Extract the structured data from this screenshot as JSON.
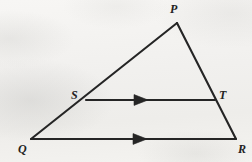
{
  "figure": {
    "background_color": "#f4f3f1",
    "stroke_color": "#252525",
    "label_color": "#232323",
    "stroke_width": 2.1,
    "label_font_size": 12,
    "vertices": [
      {
        "name": "P",
        "label": "P",
        "x": 177,
        "y": 23,
        "label_x": 170,
        "label_y": 3,
        "role": "apex"
      },
      {
        "name": "Q",
        "label": "Q",
        "x": 31,
        "y": 139,
        "label_x": 18,
        "label_y": 143,
        "role": "base-left"
      },
      {
        "name": "R",
        "label": "R",
        "x": 236,
        "y": 139,
        "label_x": 238,
        "label_y": 143,
        "role": "base-right"
      },
      {
        "name": "S",
        "label": "S",
        "x": 86,
        "y": 100,
        "label_x": 71,
        "label_y": 89,
        "role": "point-on-PQ"
      },
      {
        "name": "T",
        "label": "T",
        "x": 214,
        "y": 100,
        "label_x": 219,
        "label_y": 89,
        "role": "point-on-PR"
      }
    ],
    "segments": [
      {
        "name": "segment-QP",
        "from": "Q",
        "to": "P",
        "x1": 31,
        "y1": 139,
        "x2": 177,
        "y2": 23,
        "arrow": false
      },
      {
        "name": "segment-PR",
        "from": "P",
        "to": "R",
        "x1": 177,
        "y1": 23,
        "x2": 236,
        "y2": 139,
        "arrow": false
      },
      {
        "name": "segment-ST",
        "from": "S",
        "to": "T",
        "x1": 86,
        "y1": 100,
        "x2": 215,
        "y2": 100,
        "arrow": true
      },
      {
        "name": "segment-QR",
        "from": "Q",
        "to": "R",
        "x1": 31,
        "y1": 139,
        "x2": 236,
        "y2": 139,
        "arrow": true
      }
    ],
    "arrow_markers": [
      {
        "name": "parallel-arrow-ST",
        "x": 142,
        "y": 100,
        "direction": "right",
        "on_segment": "segment-ST"
      },
      {
        "name": "parallel-arrow-QR",
        "x": 141,
        "y": 139,
        "direction": "right",
        "on_segment": "segment-QR"
      }
    ]
  }
}
